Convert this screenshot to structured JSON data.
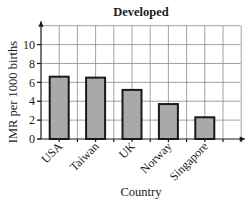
{
  "chart_data": {
    "type": "bar",
    "title": "Developed",
    "xlabel": "Country",
    "ylabel": "IMR per 1000 births",
    "categories": [
      "USA",
      "Taiwan",
      "UK",
      "Norway",
      "Singapore"
    ],
    "values": [
      6.6,
      6.5,
      5.2,
      3.7,
      2.3
    ],
    "ylim": [
      0,
      12
    ],
    "yticks": [
      0,
      2,
      4,
      6,
      8,
      10
    ],
    "ytick_labels": [
      "0",
      "2",
      "4",
      "6",
      "8",
      "10"
    ],
    "grid": true,
    "legend": null,
    "colors": {
      "bar_fill": "#a9a9a9",
      "bar_edge": "#1a1a1a",
      "grid": "#8a8a8a"
    }
  }
}
